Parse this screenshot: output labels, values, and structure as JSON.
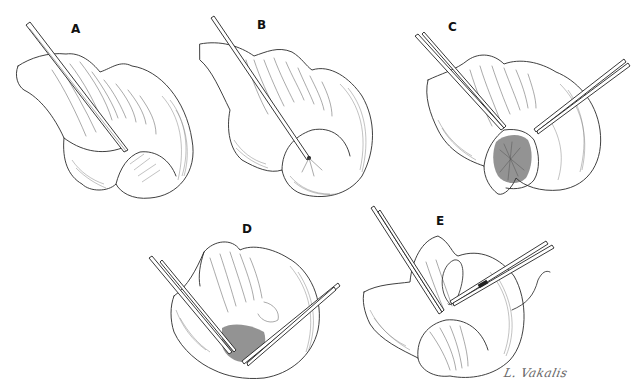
{
  "figure": {
    "panels": [
      {
        "id": "A",
        "label": "A",
        "description": "Rectal prolapse/intussusception with single instrument inserted at apex"
      },
      {
        "id": "B",
        "label": "B",
        "description": "Instrument probe inserted into lumen of everted bowel"
      },
      {
        "id": "C",
        "label": "C",
        "description": "Two instruments opening the bowel wall exposing mucosa"
      },
      {
        "id": "D",
        "label": "D",
        "description": "Two instruments with dissection of mucosal layer"
      },
      {
        "id": "E",
        "label": "E",
        "description": "Suture placement with needle holder and forceps"
      }
    ],
    "signature": "L. Vakalis",
    "style": {
      "ink": "#2a2a2a",
      "background": "#ffffff"
    }
  }
}
